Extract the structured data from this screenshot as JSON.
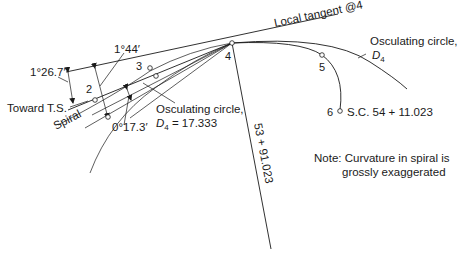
{
  "diagram": {
    "labels": {
      "local_tangent": "Local tangent @4",
      "osc_circle_right_line1": "Osculating circle,",
      "osc_circle_right_line2_D": "D",
      "osc_circle_right_line2_sub": "4",
      "osc_circle_left_line1": "Osculating circle,",
      "osc_circle_left_D": "D",
      "osc_circle_left_sub": "4",
      "osc_circle_left_value": " = 17.333",
      "angle_1_44": "1°44′",
      "angle_1_26_7": "1°26.7′",
      "angle_0_17_3": "0°17.3′",
      "toward_ts": "Toward T.S.",
      "spiral": "Spiral",
      "station_radial": "53 + 91.023",
      "sc_station": "S.C. 54 + 11.023",
      "note_line1": "Note: Curvature in spiral is",
      "note_line2": "grossly exaggerated"
    },
    "points": [
      {
        "id": "2",
        "label": "2"
      },
      {
        "id": "3",
        "label": "3"
      },
      {
        "id": "4",
        "label": "4"
      },
      {
        "id": "5",
        "label": "5"
      },
      {
        "id": "6",
        "label": "6"
      }
    ],
    "colors": {
      "line": "#1a1a1a",
      "background": "#ffffff"
    }
  }
}
